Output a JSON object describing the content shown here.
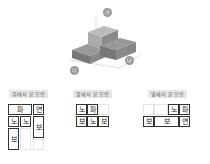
{
  "iso": {
    "markers": [
      "가",
      "나",
      "다"
    ]
  },
  "views": [
    {
      "label": "위에서 본 모양"
    },
    {
      "label": "앞에서 본 모양"
    },
    {
      "label": "옆에서 본 모양"
    }
  ],
  "top": {
    "pa": "파",
    "yeon": "연",
    "no1": "노",
    "no2": "노",
    "bo1": "보",
    "bo2": "보"
  },
  "front": {
    "no1": "노",
    "pa": "파",
    "bo1": "보",
    "no2": "노",
    "bo2": "보"
  },
  "side": {
    "no": "노",
    "pa": "파",
    "bo1": "보",
    "bo2": "보",
    "yeon": "연"
  }
}
